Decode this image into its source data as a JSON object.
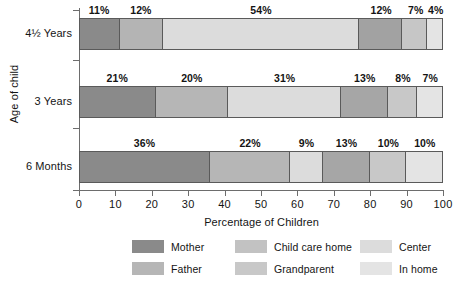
{
  "chart_data": {
    "type": "bar",
    "orientation": "horizontal",
    "stacked": true,
    "normalized_percent": true,
    "title": "",
    "xlabel": "Percentage of Children",
    "ylabel": "Age of child",
    "xlim": [
      0,
      100
    ],
    "xticks": [
      "0",
      "10",
      "20",
      "30",
      "40",
      "50",
      "60",
      "70",
      "80",
      "90",
      "100"
    ],
    "grid": false,
    "legend_position": "bottom",
    "categories": [
      "4½ Years",
      "3 Years",
      "6 Months"
    ],
    "series": [
      {
        "name": "Mother",
        "color": "#8a8a8a",
        "values": [
          11,
          21,
          36
        ]
      },
      {
        "name": "Father",
        "color": "#b4b4b4",
        "values": [
          12,
          20,
          22
        ]
      },
      {
        "name": "Child care home",
        "color": "#d8d8d8",
        "values": [
          54,
          31,
          9
        ]
      },
      {
        "name": "Grandparent",
        "color": "#a2a2a2",
        "values": [
          12,
          13,
          13
        ]
      },
      {
        "name": "Center",
        "color": "#c6c6c6",
        "values": [
          7,
          8,
          10
        ]
      },
      {
        "name": "In home",
        "color": "#e3e3e3",
        "values": [
          4,
          7,
          10
        ]
      }
    ],
    "rows": [
      {
        "label": "4½ Years",
        "segments": [
          {
            "name": "Mother",
            "value": 11,
            "label": "11%",
            "color": "#8a8a8a"
          },
          {
            "name": "Father",
            "value": 12,
            "label": "12%",
            "color": "#b4b4b4"
          },
          {
            "name": "Child care home",
            "value": 54,
            "label": "54%",
            "color": "#dcdcdc"
          },
          {
            "name": "Grandparent",
            "value": 12,
            "label": "12%",
            "color": "#a2a2a2"
          },
          {
            "name": "Center",
            "value": 7,
            "label": "7%",
            "color": "#c6c6c6"
          },
          {
            "name": "In home",
            "value": 4,
            "label": "4%",
            "color": "#e4e4e4"
          }
        ]
      },
      {
        "label": "3 Years",
        "segments": [
          {
            "name": "Mother",
            "value": 21,
            "label": "21%",
            "color": "#8a8a8a"
          },
          {
            "name": "Father",
            "value": 20,
            "label": "20%",
            "color": "#b6b6b6"
          },
          {
            "name": "Child care home",
            "value": 31,
            "label": "31%",
            "color": "#dcdcdc"
          },
          {
            "name": "Grandparent",
            "value": 13,
            "label": "13%",
            "color": "#a6a6a6"
          },
          {
            "name": "Center",
            "value": 8,
            "label": "8%",
            "color": "#c8c8c8"
          },
          {
            "name": "In home",
            "value": 7,
            "label": "7%",
            "color": "#e4e4e4"
          }
        ]
      },
      {
        "label": "6 Months",
        "segments": [
          {
            "name": "Mother",
            "value": 36,
            "label": "36%",
            "color": "#8a8a8a"
          },
          {
            "name": "Father",
            "value": 22,
            "label": "22%",
            "color": "#b6b6b6"
          },
          {
            "name": "Child care home",
            "value": 9,
            "label": "9%",
            "color": "#dcdcdc"
          },
          {
            "name": "Grandparent",
            "value": 13,
            "label": "13%",
            "color": "#a6a6a6"
          },
          {
            "name": "Center",
            "value": 10,
            "label": "10%",
            "color": "#c8c8c8"
          },
          {
            "name": "In home",
            "value": 10,
            "label": "10%",
            "color": "#e4e4e4"
          }
        ]
      }
    ],
    "legend": [
      {
        "label": "Mother",
        "color": "#8a8a8a",
        "col": 0,
        "row": 0
      },
      {
        "label": "Father",
        "color": "#b6b6b6",
        "col": 0,
        "row": 1
      },
      {
        "label": "Child care home",
        "color": "#c2c2c2",
        "col": 1,
        "row": 0
      },
      {
        "label": "Grandparent",
        "color": "#c8c8c8",
        "col": 1,
        "row": 1
      },
      {
        "label": "Center",
        "color": "#dcdcdc",
        "col": 2,
        "row": 0
      },
      {
        "label": "In home",
        "color": "#e4e4e4",
        "col": 2,
        "row": 1
      }
    ]
  }
}
